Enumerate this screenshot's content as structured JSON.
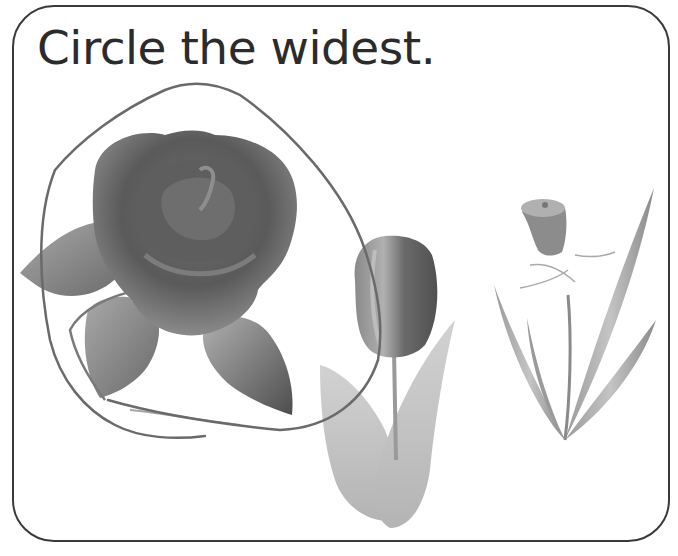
{
  "worksheet": {
    "instruction": "Circle the widest.",
    "items": [
      {
        "name": "rose",
        "label": "Rose",
        "circled": true
      },
      {
        "name": "tulip",
        "label": "Tulip",
        "circled": false
      },
      {
        "name": "daffodil",
        "label": "Daffodil",
        "circled": false
      }
    ],
    "colors": {
      "border": "#3a3a3a",
      "text": "#2b2b2b",
      "pencil_mark": "#6a6a6a"
    }
  }
}
